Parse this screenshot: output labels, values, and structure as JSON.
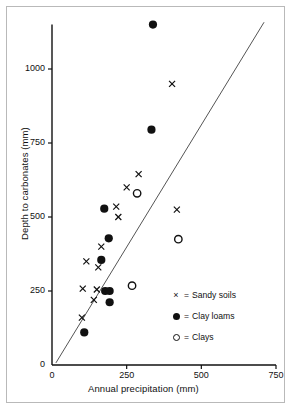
{
  "chart_data": {
    "type": "scatter",
    "title": "",
    "xlabel": "Annual precipitation (mm)",
    "ylabel": "Depth to carbonates (mm)",
    "xlim": [
      0,
      750
    ],
    "ylim": [
      0,
      1150
    ],
    "xticks": [
      0,
      250,
      500,
      750
    ],
    "xtick_labels": [
      "0",
      "250",
      "500",
      "750"
    ],
    "yticks": [
      0,
      250,
      500,
      750,
      1000
    ],
    "ytick_labels": [
      "0",
      "250",
      "500",
      "750",
      "1000"
    ],
    "grid": false,
    "legend_position": "lower-right",
    "series": [
      {
        "name": "Sandy soils",
        "marker": "x",
        "color": "#111111",
        "points": [
          [
            100,
            160
          ],
          [
            103,
            258
          ],
          [
            115,
            350
          ],
          [
            140,
            220
          ],
          [
            150,
            255
          ],
          [
            155,
            330
          ],
          [
            165,
            400
          ],
          [
            215,
            535
          ],
          [
            222,
            500
          ],
          [
            250,
            600
          ],
          [
            290,
            645
          ],
          [
            402,
            950
          ],
          [
            418,
            525
          ]
        ]
      },
      {
        "name": "Clay loams",
        "marker": "filled-circle",
        "color": "#111111",
        "points": [
          [
            108,
            110
          ],
          [
            178,
            250
          ],
          [
            193,
            250
          ],
          [
            193,
            212
          ],
          [
            165,
            355
          ],
          [
            190,
            428
          ],
          [
            175,
            528
          ],
          [
            333,
            795
          ],
          [
            338,
            1150
          ]
        ]
      },
      {
        "name": "Clays",
        "marker": "open-circle",
        "color": "#111111",
        "points": [
          [
            268,
            268
          ],
          [
            285,
            580
          ],
          [
            423,
            425
          ]
        ]
      }
    ],
    "trend_line": {
      "x_start": 13,
      "y_start": 7,
      "x_end": 710,
      "y_end": 1158
    }
  },
  "legend": {
    "items": [
      {
        "marker": "x-marker",
        "equals": "=",
        "label": "Sandy soils"
      },
      {
        "marker": "filled-circle-marker",
        "equals": "=",
        "label": "Clay loams"
      },
      {
        "marker": "open-circle-marker",
        "equals": "=",
        "label": "Clays"
      }
    ]
  }
}
